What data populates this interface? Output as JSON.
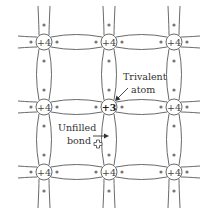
{
  "lattice": {
    "columns_x": [
      44,
      109,
      174
    ],
    "rows_y": [
      42,
      107,
      172
    ],
    "atom_radius": 8,
    "atoms": [
      {
        "row": 0,
        "col": 0,
        "label": "+4"
      },
      {
        "row": 0,
        "col": 1,
        "label": "+4"
      },
      {
        "row": 0,
        "col": 2,
        "label": "+4"
      },
      {
        "row": 1,
        "col": 0,
        "label": "+4"
      },
      {
        "row": 1,
        "col": 1,
        "label": "+3",
        "trivalent": true
      },
      {
        "row": 1,
        "col": 2,
        "label": "+4"
      },
      {
        "row": 2,
        "col": 0,
        "label": "+4"
      },
      {
        "row": 2,
        "col": 1,
        "label": "+4"
      },
      {
        "row": 2,
        "col": 2,
        "label": "+4"
      }
    ],
    "missing_electron": {
      "x": 109,
      "y": 126
    }
  },
  "annotations": {
    "trivalent_line1": "Trivalent",
    "trivalent_line2": "atom",
    "unfilled_line1": "Unfilled",
    "unfilled_line2": "bond"
  },
  "colors": {
    "stroke": "#6a6a6a",
    "text": "#333333",
    "background": "#ffffff"
  }
}
